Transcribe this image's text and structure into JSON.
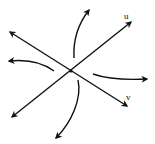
{
  "diagram": {
    "type": "phase-portrait-saddle",
    "axes": [
      {
        "label": "u",
        "from": [
          12,
          117
        ],
        "to": [
          131,
          22
        ],
        "arrows": "both"
      },
      {
        "label": "v",
        "from": [
          10,
          32
        ],
        "to": [
          127,
          106
        ],
        "arrows": "both"
      }
    ],
    "center": [
      71,
      71
    ],
    "trajectories": [
      {
        "name": "top",
        "direction": "outward"
      },
      {
        "name": "left",
        "direction": "outward"
      },
      {
        "name": "right",
        "direction": "outward"
      },
      {
        "name": "bottom",
        "direction": "outward"
      }
    ],
    "stroke_color": "#111111"
  },
  "labels": {
    "u": "u",
    "v": "v"
  }
}
